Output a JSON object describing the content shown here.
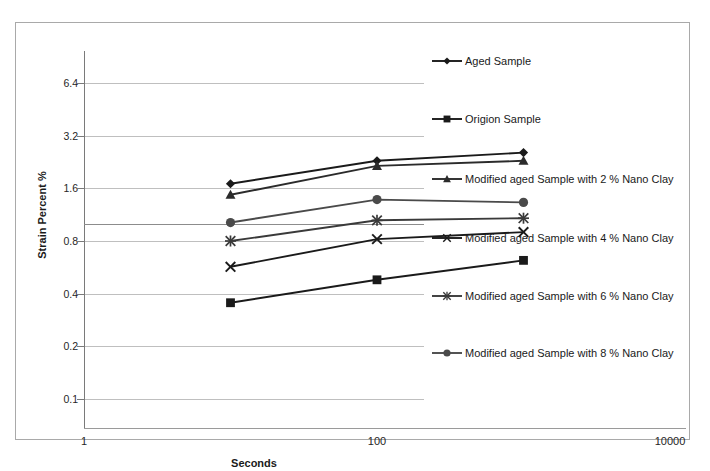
{
  "chart_data": {
    "type": "line",
    "title": "",
    "xlabel": "Seconds",
    "ylabel": "Strain Percent %",
    "xscale": "log",
    "yscale": "log",
    "xlim": [
      1,
      10000
    ],
    "ylim": [
      0.1,
      9.0
    ],
    "xticks": [
      "1",
      "100",
      "10000"
    ],
    "xtick_values": [
      1,
      100,
      10000
    ],
    "yticks": [
      "6.4",
      "3.2",
      "1.6",
      "0.8",
      "0.4",
      "0.2",
      "0.1"
    ],
    "ytick_values": [
      6.4,
      3.2,
      1.6,
      0.8,
      0.4,
      0.2,
      0.1
    ],
    "grid": true,
    "legend_position": "right",
    "x": [
      10,
      100,
      1000
    ],
    "series": [
      {
        "name": "Aged Sample",
        "marker": "diamond",
        "color": "#1a1a1a",
        "values": [
          1.7,
          2.3,
          2.56
        ]
      },
      {
        "name": "Origion Sample",
        "marker": "square",
        "color": "#1a1a1a",
        "values": [
          0.355,
          0.48,
          0.62
        ]
      },
      {
        "name": "Modified aged Sample with 2 % Nano Clay",
        "marker": "triangle",
        "color": "#2b2b2b",
        "values": [
          1.47,
          2.15,
          2.3
        ]
      },
      {
        "name": "Modified aged Sample with 4 % Nano Clay",
        "marker": "x",
        "color": "#1a1a1a",
        "values": [
          0.57,
          0.82,
          0.9
        ]
      },
      {
        "name": "Modified aged Sample with 6 % Nano Clay",
        "marker": "star",
        "color": "#3a3a3a",
        "values": [
          0.8,
          1.05,
          1.08
        ]
      },
      {
        "name": "Modified aged Sample with 8 % Nano Clay",
        "marker": "circle",
        "color": "#4a4a4a",
        "values": [
          1.02,
          1.38,
          1.33
        ]
      }
    ]
  }
}
